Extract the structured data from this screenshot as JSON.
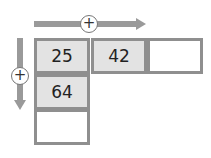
{
  "diagram": {
    "horizontal_arrow": {
      "symbol": "+",
      "direction": "right"
    },
    "vertical_arrow": {
      "symbol": "+",
      "direction": "down"
    },
    "grid": {
      "row1": [
        "25",
        "42",
        ""
      ],
      "col1": [
        "25",
        "64",
        ""
      ]
    },
    "cells": [
      {
        "id": "r1c1",
        "value": "25",
        "filled": true
      },
      {
        "id": "r1c2",
        "value": "42",
        "filled": true
      },
      {
        "id": "r1c3",
        "value": "",
        "filled": false
      },
      {
        "id": "r2c1",
        "value": "64",
        "filled": true
      },
      {
        "id": "r3c1",
        "value": "",
        "filled": false
      }
    ],
    "colors": {
      "arrow": "#9a9a9a",
      "cell_border": "#8f8f8f",
      "cell_fill": "#e3e3e3"
    }
  }
}
